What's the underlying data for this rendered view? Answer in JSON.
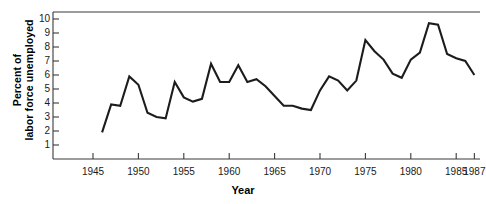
{
  "chart_data": {
    "type": "line",
    "title": "",
    "xlabel": "Year",
    "ylabel": "Percent of labor force unemployed",
    "ylabel_line1": "Percent of",
    "ylabel_line2": "labor force unemployed",
    "xlim": [
      1945.0,
      1988.0
    ],
    "ylim": [
      0.0,
      10.6
    ],
    "grid": false,
    "legend": null,
    "line_color": "#1c1c1c",
    "axis_color": "#3a3a3a",
    "ytick_labels": [
      "10",
      "9",
      "8",
      "7",
      "6",
      "5",
      "4",
      "3",
      "2",
      "1"
    ],
    "yticks": [
      10,
      9,
      8,
      7,
      6,
      5,
      4,
      3,
      2,
      1
    ],
    "xtick_labels": [
      "1945",
      "1950",
      "1955",
      "1960",
      "1965",
      "1970",
      "1975",
      "1980",
      "1985",
      "1987"
    ],
    "xticks": [
      1945,
      1950,
      1955,
      1960,
      1965,
      1970,
      1975,
      1980,
      1985,
      1987
    ],
    "x": [
      1946,
      1947,
      1948,
      1949,
      1950,
      1951,
      1952,
      1953,
      1954,
      1955,
      1956,
      1957,
      1958,
      1959,
      1960,
      1961,
      1962,
      1963,
      1964,
      1965,
      1966,
      1967,
      1968,
      1969,
      1970,
      1971,
      1972,
      1973,
      1974,
      1975,
      1976,
      1977,
      1978,
      1979,
      1980,
      1981,
      1982,
      1983,
      1984,
      1985,
      1986,
      1987
    ],
    "values": [
      1.9,
      3.9,
      3.8,
      5.9,
      5.3,
      3.3,
      3.0,
      2.9,
      5.5,
      4.4,
      4.1,
      4.3,
      6.8,
      5.5,
      5.5,
      6.7,
      5.5,
      5.7,
      5.2,
      4.5,
      3.8,
      3.8,
      3.6,
      3.5,
      4.9,
      5.9,
      5.6,
      4.9,
      5.6,
      8.5,
      7.7,
      7.1,
      6.1,
      5.8,
      7.1,
      7.6,
      9.7,
      9.6,
      7.5,
      7.2,
      7.0,
      6.0
    ],
    "series_name": "Percent of labor force unemployed"
  }
}
